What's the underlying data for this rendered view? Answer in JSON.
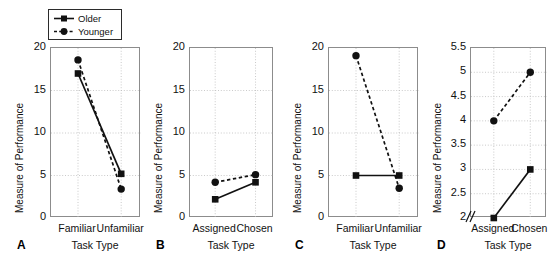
{
  "figure": {
    "legend": {
      "position": "above-panel-a",
      "entries": [
        {
          "label": "Older",
          "marker": "square-marker-icon",
          "line": "solid",
          "color": "#111111"
        },
        {
          "label": "Younger",
          "marker": "circle-marker-icon",
          "line": "dashed",
          "color": "#111111"
        }
      ]
    }
  },
  "chart_data": [
    {
      "type": "line",
      "panel": "A",
      "title": "",
      "xlabel": "Task Type",
      "ylabel": "Measure of Performance",
      "categories": [
        "Familiar",
        "Unfamiliar"
      ],
      "yticks": [
        "0",
        "5",
        "10",
        "15",
        "20"
      ],
      "ylim": [
        0,
        20
      ],
      "grid": true,
      "legend": "shared-top-left",
      "series": [
        {
          "name": "Older",
          "values": [
            17.0,
            5.2
          ],
          "line": "solid",
          "marker": "square"
        },
        {
          "name": "Younger",
          "values": [
            18.6,
            3.4
          ],
          "line": "dashed",
          "marker": "circle"
        }
      ]
    },
    {
      "type": "line",
      "panel": "B",
      "title": "",
      "xlabel": "Task Type",
      "ylabel": "Measure of Performance",
      "categories": [
        "Assigned",
        "Chosen"
      ],
      "yticks": [
        "0",
        "5",
        "10",
        "15",
        "20"
      ],
      "ylim": [
        0,
        20
      ],
      "grid": true,
      "legend": "shared-top-left",
      "series": [
        {
          "name": "Older",
          "values": [
            2.2,
            4.2
          ],
          "line": "solid",
          "marker": "square"
        },
        {
          "name": "Younger",
          "values": [
            4.2,
            5.1
          ],
          "line": "dashed",
          "marker": "circle"
        }
      ]
    },
    {
      "type": "line",
      "panel": "C",
      "title": "",
      "xlabel": "Task Type",
      "ylabel": "Measure of Performance",
      "categories": [
        "Familiar",
        "Unfamiliar"
      ],
      "yticks": [
        "0",
        "5",
        "10",
        "15",
        "20"
      ],
      "ylim": [
        0,
        20
      ],
      "grid": true,
      "legend": "shared-top-left",
      "series": [
        {
          "name": "Older",
          "values": [
            5.0,
            5.0
          ],
          "line": "solid",
          "marker": "square"
        },
        {
          "name": "Younger",
          "values": [
            19.1,
            3.5
          ],
          "line": "dashed",
          "marker": "circle"
        }
      ]
    },
    {
      "type": "line",
      "panel": "D",
      "title": "",
      "xlabel": "Task Type",
      "ylabel": "Measure of Performance",
      "categories": [
        "Assigned",
        "Chosen"
      ],
      "yticks": [
        "2",
        "2.5",
        "3",
        "3.5",
        "4",
        "4.5",
        "5",
        "5.5"
      ],
      "ylim": [
        2,
        5.5
      ],
      "axis_break": true,
      "grid": true,
      "legend": "shared-top-left",
      "series": [
        {
          "name": "Older",
          "values": [
            2.0,
            3.0
          ],
          "line": "solid",
          "marker": "square"
        },
        {
          "name": "Younger",
          "values": [
            4.0,
            5.0
          ],
          "line": "dashed",
          "marker": "circle"
        }
      ]
    }
  ]
}
